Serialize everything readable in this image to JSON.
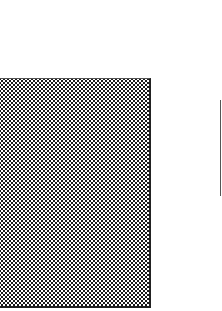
{
  "panel": {
    "pattern": "halftone-dots",
    "dot_color": "#1a1a1a",
    "background_color": "#ffffff",
    "border_color": "#222222"
  },
  "edge_line": {
    "color": "#555555"
  }
}
